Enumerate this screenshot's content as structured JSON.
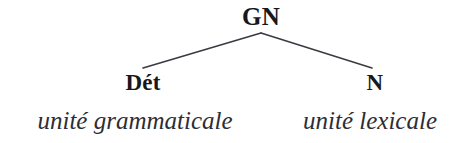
{
  "diagram": {
    "type": "syntax-tree",
    "language": "fr",
    "background_color": "#ffffff",
    "line_color": "#3a3a42",
    "text_color": "#17171c",
    "gloss_color": "#2d2d34",
    "root": {
      "label": "GN"
    },
    "children": [
      {
        "label": "Dét",
        "gloss": "unité grammaticale"
      },
      {
        "label": "N",
        "gloss": "unité lexicale"
      }
    ],
    "edges": [
      {
        "name": "edge-root-to-det",
        "x1": 261,
        "y1": 33,
        "x2": 143,
        "y2": 68
      },
      {
        "name": "edge-root-to-n",
        "x1": 261,
        "y1": 33,
        "x2": 372,
        "y2": 68
      }
    ]
  }
}
